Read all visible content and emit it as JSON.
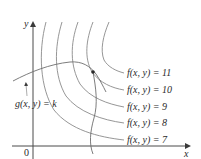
{
  "figure": {
    "axes": {
      "x_label": "x",
      "y_label": "y",
      "origin_label": "0"
    },
    "constraint": {
      "label": "g(x, y) = k"
    },
    "level_curves": [
      {
        "label": "f(x, y) = 11",
        "value": 11
      },
      {
        "label": "f(x, y) = 10",
        "value": 10
      },
      {
        "label": "f(x, y) = 9",
        "value": 9
      },
      {
        "label": "f(x, y) = 8",
        "value": 8
      },
      {
        "label": "f(x, y) = 7",
        "value": 7
      }
    ],
    "tangent_point": {
      "marker": "dot"
    },
    "colors": {
      "axis": "#4a4a4a",
      "curve": "#8a8a8a",
      "text": "#2a2a2a"
    }
  }
}
